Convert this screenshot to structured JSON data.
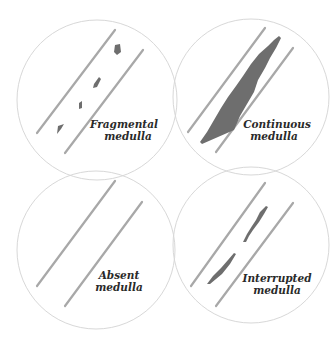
{
  "panels": [
    {
      "id": "fragmental",
      "label_line1": "Fragmental",
      "label_line2": "medulla",
      "cx": 97,
      "cy": 100,
      "r": 80
    },
    {
      "id": "continuous",
      "label_line1": "Continuous",
      "label_line2": "medulla",
      "cx": 251,
      "cy": 97,
      "r": 78
    },
    {
      "id": "absent",
      "label_line1": "Absent",
      "label_line2": "medulla",
      "cx": 96,
      "cy": 250,
      "r": 79
    },
    {
      "id": "interrupted",
      "label_line1": "Interrupted",
      "label_line2": "medulla",
      "cx": 251,
      "cy": 245,
      "r": 78
    }
  ],
  "colors": {
    "circle_stroke": "#d8d8d8",
    "hair_edge": "#a8a8a8",
    "medulla": "#6e6e6e"
  }
}
